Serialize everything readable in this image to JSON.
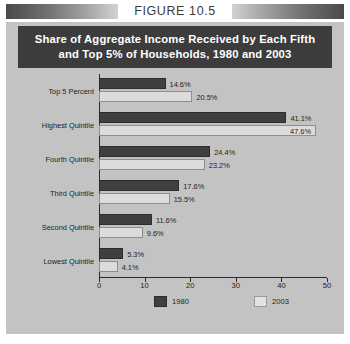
{
  "figure": {
    "caption": "FIGURE 10.5"
  },
  "banner": {
    "line1": "Share of Aggregate Income Received by Each Fifth",
    "line2": "and Top 5% of Households, 1980 and 2003"
  },
  "colors": {
    "series_1980": "#3f3f3f",
    "series_2003": "#dcdcdc",
    "panel_background": "#c3c3c3",
    "banner_background": "#3c3c3c",
    "axis": "#2b2b2b",
    "text": "#1d1d1d"
  },
  "chart_data": {
    "type": "bar",
    "orientation": "horizontal",
    "title": "Share of Aggregate Income Received by Each Fifth and Top 5% of Households, 1980 and 2003",
    "xlabel": "",
    "ylabel": "",
    "xlim": [
      0,
      50
    ],
    "xticks": [
      0,
      10,
      20,
      30,
      40,
      50
    ],
    "xtick_labels": [
      "0",
      "10",
      "20",
      "30",
      "40",
      "50"
    ],
    "grid": false,
    "legend_position": "bottom",
    "categories": [
      "Top 5 Percent",
      "Highest Quintile",
      "Fourth Quintile",
      "Third Quintile",
      "Second Quintile",
      "Lowest Quintile"
    ],
    "series": [
      {
        "name": "1980",
        "values": [
          14.6,
          41.1,
          24.4,
          17.6,
          11.6,
          5.3
        ],
        "labels": [
          "14.6%",
          "41.1%",
          "24.4%",
          "17.6%",
          "11.6%",
          "5.3%"
        ]
      },
      {
        "name": "2003",
        "values": [
          20.5,
          47.6,
          23.2,
          15.5,
          9.6,
          4.1
        ],
        "labels": [
          "20.5%",
          "47.6%",
          "23.2%",
          "15.5%",
          "9.6%",
          "4.1%"
        ]
      }
    ]
  }
}
